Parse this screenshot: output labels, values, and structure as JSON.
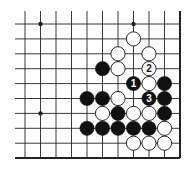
{
  "diagram": {
    "type": "go-board-fragment",
    "grid": {
      "columns": 11,
      "rows": 10,
      "origin_x": 25,
      "origin_y": 24,
      "spacing_x": 15.5,
      "spacing_y": 14.9,
      "left_extent": 15,
      "top_extent": 11,
      "right_edge_col": 10,
      "bottom_edge_row": 9
    },
    "star_points": [
      {
        "col": 1,
        "row": 0
      },
      {
        "col": 7,
        "row": 0
      },
      {
        "col": 1,
        "row": 6
      }
    ],
    "stones": [
      {
        "color": "white",
        "col": 7,
        "row": 1,
        "label": ""
      },
      {
        "color": "white",
        "col": 6,
        "row": 2,
        "label": ""
      },
      {
        "color": "white",
        "col": 8,
        "row": 2,
        "label": ""
      },
      {
        "color": "black",
        "col": 5,
        "row": 3,
        "label": ""
      },
      {
        "color": "white",
        "col": 6,
        "row": 3,
        "label": ""
      },
      {
        "color": "white",
        "col": 8,
        "row": 3,
        "label": "2"
      },
      {
        "color": "black",
        "col": 7,
        "row": 4,
        "label": "1"
      },
      {
        "color": "white",
        "col": 8,
        "row": 4,
        "label": ""
      },
      {
        "color": "black",
        "col": 9,
        "row": 4,
        "label": ""
      },
      {
        "color": "black",
        "col": 4,
        "row": 5,
        "label": ""
      },
      {
        "color": "black",
        "col": 5,
        "row": 5,
        "label": ""
      },
      {
        "color": "white",
        "col": 6,
        "row": 5,
        "label": ""
      },
      {
        "color": "black",
        "col": 8,
        "row": 5,
        "label": "3"
      },
      {
        "color": "black",
        "col": 9,
        "row": 5,
        "label": ""
      },
      {
        "color": "white",
        "col": 5,
        "row": 6,
        "label": ""
      },
      {
        "color": "black",
        "col": 6,
        "row": 6,
        "label": ""
      },
      {
        "color": "white",
        "col": 7,
        "row": 6,
        "label": ""
      },
      {
        "color": "white",
        "col": 8,
        "row": 6,
        "label": ""
      },
      {
        "color": "black",
        "col": 9,
        "row": 6,
        "label": ""
      },
      {
        "color": "black",
        "col": 4,
        "row": 7,
        "label": ""
      },
      {
        "color": "black",
        "col": 5,
        "row": 7,
        "label": ""
      },
      {
        "color": "black",
        "col": 6,
        "row": 7,
        "label": ""
      },
      {
        "color": "black",
        "col": 7,
        "row": 7,
        "label": ""
      },
      {
        "color": "black",
        "col": 8,
        "row": 7,
        "label": ""
      },
      {
        "color": "white",
        "col": 9,
        "row": 7,
        "label": ""
      },
      {
        "color": "white",
        "col": 7,
        "row": 8,
        "label": ""
      },
      {
        "color": "white",
        "col": 8,
        "row": 8,
        "label": ""
      },
      {
        "color": "white",
        "col": 9,
        "row": 8,
        "label": ""
      }
    ],
    "move_labels": [
      "1",
      "2",
      "3"
    ],
    "colors": {
      "line": "#222222",
      "black_stone": "#111111",
      "white_stone": "#ffffff",
      "background": "#ffffff"
    }
  }
}
